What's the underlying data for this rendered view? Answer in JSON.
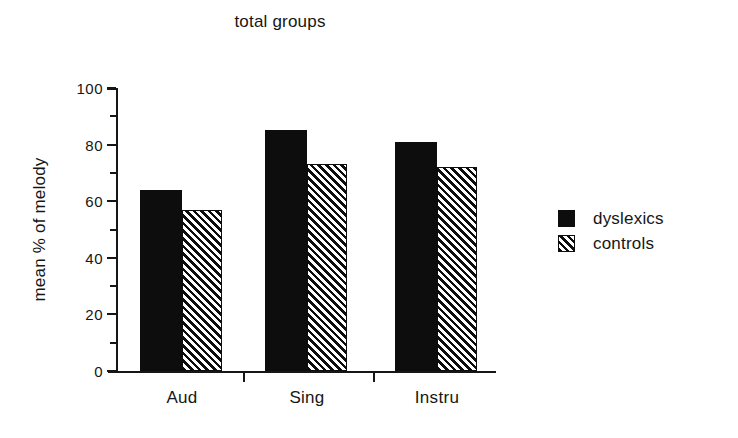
{
  "chart_data": {
    "type": "bar",
    "title": "total groups",
    "xlabel": "",
    "ylabel": "mean % of melody",
    "categories": [
      "Aud",
      "Sing",
      "Instru"
    ],
    "series": [
      {
        "name": "dyslexics",
        "values": [
          64,
          85,
          81
        ],
        "fill": "solid",
        "color": "#0d0d0d"
      },
      {
        "name": "controls",
        "values": [
          57,
          73,
          72
        ],
        "fill": "hatched",
        "color": "#0d0d0d"
      }
    ],
    "ylim": [
      0,
      100
    ],
    "y_major_ticks": [
      0,
      20,
      40,
      60,
      80,
      100
    ],
    "y_minor_ticks": [
      10,
      30,
      50,
      70,
      90
    ],
    "y_tick_labels": [
      "0",
      "20",
      "40",
      "60",
      "80",
      "100"
    ],
    "grid": false,
    "legend_position": "right"
  },
  "legend": {
    "entries": [
      {
        "label": "dyslexics"
      },
      {
        "label": "controls"
      }
    ]
  }
}
